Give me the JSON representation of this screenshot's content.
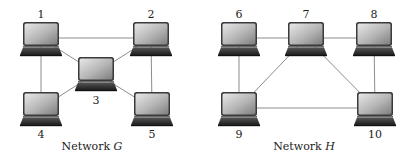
{
  "networks": [
    {
      "id": "G",
      "caption_prefix": "Network ",
      "caption_var": "G",
      "caption_x": 92,
      "nodes": [
        {
          "id": "1",
          "label": "1",
          "x": 41,
          "y": 34,
          "label_x": 41,
          "label_y": 18
        },
        {
          "id": "2",
          "label": "2",
          "x": 151,
          "y": 34,
          "label_x": 151,
          "label_y": 18
        },
        {
          "id": "3",
          "label": "3",
          "x": 96,
          "y": 69,
          "label_x": 96,
          "label_y": 104
        },
        {
          "id": "4",
          "label": "4",
          "x": 41,
          "y": 104,
          "label_x": 41,
          "label_y": 138
        },
        {
          "id": "5",
          "label": "5",
          "x": 152,
          "y": 104,
          "label_x": 152,
          "label_y": 138
        }
      ],
      "edges": [
        [
          "1",
          "2"
        ],
        [
          "1",
          "4"
        ],
        [
          "2",
          "5"
        ],
        [
          "1",
          "3"
        ],
        [
          "2",
          "3"
        ],
        [
          "3",
          "4"
        ],
        [
          "3",
          "5"
        ]
      ]
    },
    {
      "id": "H",
      "caption_prefix": "Network ",
      "caption_var": "H",
      "caption_x": 304,
      "nodes": [
        {
          "id": "6",
          "label": "6",
          "x": 239,
          "y": 34,
          "label_x": 239,
          "label_y": 18
        },
        {
          "id": "7",
          "label": "7",
          "x": 306,
          "y": 34,
          "label_x": 306,
          "label_y": 18
        },
        {
          "id": "8",
          "label": "8",
          "x": 374,
          "y": 34,
          "label_x": 374,
          "label_y": 18
        },
        {
          "id": "9",
          "label": "9",
          "x": 239,
          "y": 104,
          "label_x": 239,
          "label_y": 138
        },
        {
          "id": "10",
          "label": "10",
          "x": 375,
          "y": 104,
          "label_x": 375,
          "label_y": 138
        }
      ],
      "edges": [
        [
          "6",
          "7"
        ],
        [
          "7",
          "8"
        ],
        [
          "6",
          "9"
        ],
        [
          "8",
          "10"
        ],
        [
          "7",
          "9"
        ],
        [
          "7",
          "10"
        ],
        [
          "9",
          "10"
        ]
      ]
    }
  ],
  "caption_y": 150,
  "colors": {
    "edge": "#8c8c8c",
    "screen_light": "#e4e4e4",
    "screen_dark": "#8a8a8a",
    "bezel": "#3a3a3a",
    "keyboard": "#2b2b2b"
  }
}
